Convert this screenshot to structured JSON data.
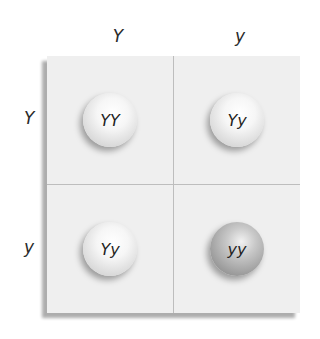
{
  "diagram": {
    "type": "punnett-square",
    "column_alleles": [
      "Y",
      "y"
    ],
    "row_alleles": [
      "Y",
      "y"
    ],
    "cells": [
      {
        "row": 0,
        "col": 0,
        "genotype": "YY",
        "shade": "light"
      },
      {
        "row": 0,
        "col": 1,
        "genotype": "Yy",
        "shade": "light"
      },
      {
        "row": 1,
        "col": 0,
        "genotype": "Yy",
        "shade": "light"
      },
      {
        "row": 1,
        "col": 1,
        "genotype": "yy",
        "shade": "dark"
      }
    ]
  }
}
